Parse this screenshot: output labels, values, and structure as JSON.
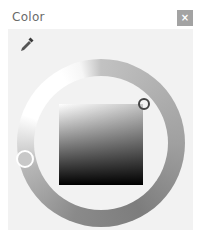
{
  "dialog": {
    "title": "Color",
    "close_label": "×",
    "close_icon": "close-icon",
    "eyedropper_icon": "eyedropper-icon"
  },
  "picker": {
    "type": "hue-ring-with-saturation-value-square",
    "hue_marker_color": "#c8c8c8",
    "square_top_left": "#ffffff",
    "square_top_right": "#c4c4c4",
    "square_bottom": "#000000",
    "selected_color_marker": "top-right"
  }
}
